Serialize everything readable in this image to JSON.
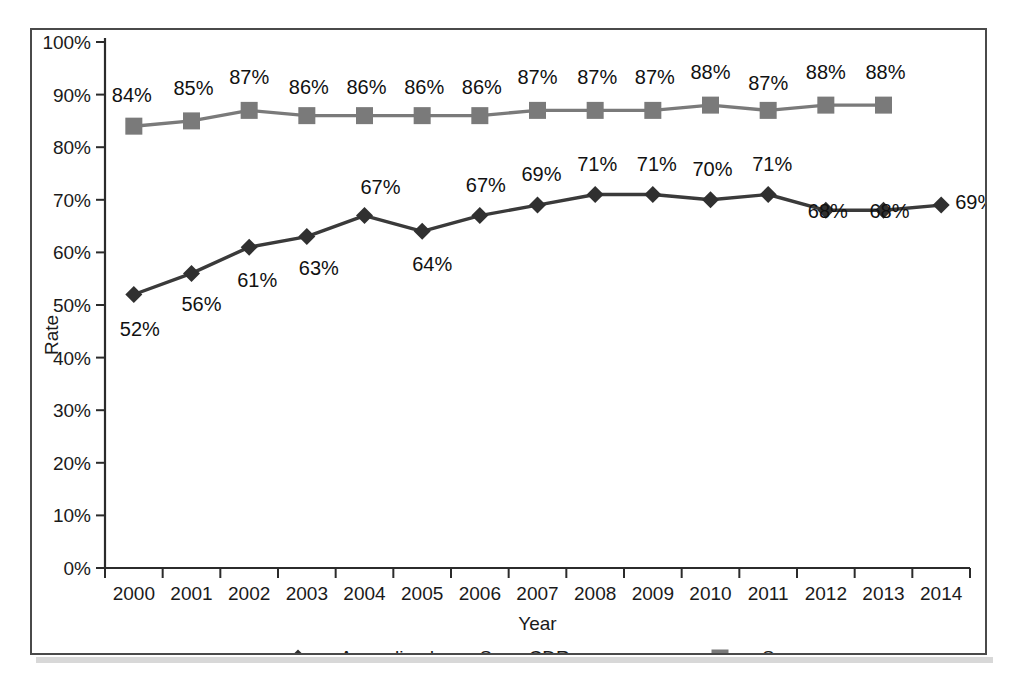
{
  "chart_data": {
    "type": "line",
    "title": "",
    "xlabel": "Year",
    "ylabel": "Rate",
    "ylim": [
      0,
      100
    ],
    "y_ticks": [
      "0%",
      "10%",
      "20%",
      "30%",
      "40%",
      "50%",
      "60%",
      "70%",
      "80%",
      "90%",
      "100%"
    ],
    "y_tick_values": [
      0,
      10,
      20,
      30,
      40,
      50,
      60,
      70,
      80,
      90,
      100
    ],
    "grid": false,
    "legend_position": "bottom",
    "categories": [
      "2000",
      "2001",
      "2002",
      "2003",
      "2004",
      "2005",
      "2006",
      "2007",
      "2008",
      "2009",
      "2010",
      "2011",
      "2012",
      "2013",
      "2014"
    ],
    "series": [
      {
        "name": "Annualised new S+ve CDR",
        "marker": "diamond",
        "color": "#303030",
        "values": [
          52,
          56,
          61,
          63,
          67,
          64,
          67,
          69,
          71,
          71,
          70,
          71,
          68,
          68,
          69
        ],
        "labels": [
          "52%",
          "56%",
          "61%",
          "63%",
          "67%",
          "64%",
          "67%",
          "69%",
          "71%",
          "71%",
          "70%",
          "71%",
          "68%",
          "68%",
          "69%"
        ]
      },
      {
        "name": "Success",
        "marker": "square",
        "color": "#7a7a7a",
        "values": [
          84,
          85,
          87,
          86,
          86,
          86,
          86,
          87,
          87,
          87,
          88,
          87,
          88,
          88,
          null
        ],
        "labels": [
          "84%",
          "85%",
          "87%",
          "86%",
          "86%",
          "86%",
          "86%",
          "87%",
          "87%",
          "87%",
          "88%",
          "87%",
          "88%",
          "88%",
          null
        ]
      }
    ]
  },
  "legend": {
    "items": [
      {
        "label": "Annualised new S+ve CDR",
        "marker": "diamond",
        "color": "#303030"
      },
      {
        "label": "Success",
        "marker": "square",
        "color": "#7a7a7a"
      }
    ]
  },
  "axes": {
    "y_title": "Rate",
    "x_title": "Year"
  },
  "colors": {
    "cdr": "#303030",
    "success": "#7a7a7a",
    "axis": "#2b2b2b",
    "frame": "#4a4a4a",
    "background": "#ffffff"
  }
}
